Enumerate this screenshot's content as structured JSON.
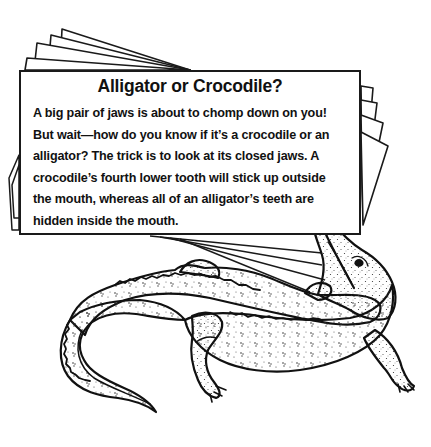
{
  "card": {
    "title": "Alligator or Crocodile?",
    "body_lines": [
      "A big pair of jaws is about to chomp down on you!",
      "But wait—how do you know if it’s a crocodile or an",
      "alligator? The trick is to look at its closed jaws. A",
      "crocodile’s fourth lower tooth will stick up outside",
      "the mouth, whereas all of an alligator’s teeth are",
      "hidden inside the mouth."
    ]
  },
  "illustration": {
    "subject": "alligator",
    "style": "black line art with stipple shading",
    "stroke_color": "#1a1a1a",
    "background_color": "#ffffff",
    "stacked_cards_behind": 4,
    "fan_lines": 4
  }
}
